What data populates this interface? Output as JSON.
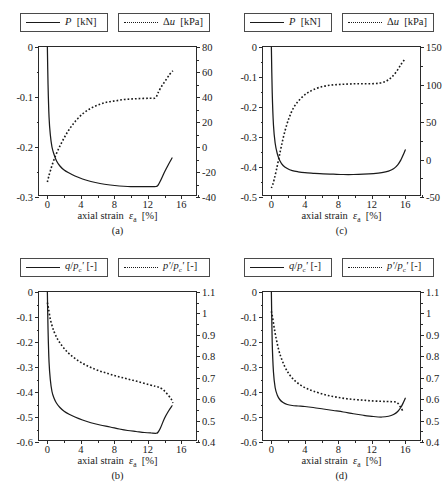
{
  "figure": {
    "width": 448,
    "height": 489,
    "background": "#ffffff",
    "line_color": "#1a1a1a",
    "axis_color": "#2a2a2a"
  },
  "common": {
    "xlabel_prefix": "axial strain ",
    "xlabel_symbol": "ε",
    "xlabel_sub": "a",
    "xlabel_unit": "[%]",
    "xticks": [
      0,
      4,
      8,
      12,
      16
    ],
    "xlim": [
      -1,
      18
    ],
    "xminor": [
      2,
      6,
      10,
      14,
      18
    ]
  },
  "panels": [
    {
      "tag": "(a)",
      "legend": {
        "solid": {
          "symbol": "P",
          "unit": "[kN]",
          "style": "solid"
        },
        "dashed": {
          "symbol": "Δu",
          "unit": "[kPa]",
          "style": "dotted"
        }
      },
      "left_axis": {
        "label": "P [kN]",
        "ticks": [
          0,
          -0.1,
          -0.2,
          -0.3
        ],
        "ticklabels": [
          "0",
          "-0.1",
          "-0.2",
          "-0.3"
        ],
        "lim": [
          -0.3,
          0
        ]
      },
      "right_axis": {
        "label": "Δu [kPa]",
        "ticks": [
          80,
          60,
          40,
          20,
          0,
          -20,
          -40
        ],
        "ticklabels": [
          "80",
          "60",
          "40",
          "20",
          "0",
          "-20",
          "-40"
        ],
        "lim": [
          -40,
          80
        ]
      },
      "chart_data": {
        "type": "line",
        "title": "",
        "xlabel": "axial strain εa [%]",
        "ylabel": "P [kN]",
        "y2label": "Δu [kPa]",
        "xlim": [
          -1,
          18
        ],
        "ylim": [
          -0.3,
          0
        ],
        "y2lim": [
          -40,
          80
        ],
        "grid": false,
        "legend_position": "above-plot",
        "series": [
          {
            "name": "P [kN]",
            "axis": "left",
            "style": "solid",
            "x": [
              0.0,
              0.08,
              0.2,
              0.35,
              0.55,
              0.8,
              1.1,
              1.5,
              2.0,
              2.6,
              3.3,
              4.2,
              5.2,
              6.3,
              7.5,
              8.6,
              9.6,
              10.6,
              11.6,
              12.4,
              13.0,
              13.2,
              13.5,
              14.0,
              14.5,
              14.9
            ],
            "y": [
              0.0,
              -0.075,
              -0.14,
              -0.175,
              -0.2,
              -0.215,
              -0.228,
              -0.238,
              -0.246,
              -0.252,
              -0.258,
              -0.264,
              -0.269,
              -0.273,
              -0.276,
              -0.278,
              -0.279,
              -0.279,
              -0.279,
              -0.279,
              -0.279,
              -0.277,
              -0.268,
              -0.25,
              -0.234,
              -0.222
            ]
          },
          {
            "name": "Δu [kPa]",
            "axis": "right",
            "style": "dotted",
            "x": [
              0.0,
              0.15,
              0.4,
              0.8,
              1.3,
              1.9,
              2.6,
              3.4,
              4.3,
              5.2,
              6.2,
              7.2,
              8.2,
              9.2,
              10.2,
              11.2,
              12.2,
              12.9,
              13.2,
              13.6,
              14.1,
              14.6,
              15.0
            ],
            "y": [
              -28.0,
              -24.0,
              -18.0,
              -10.0,
              -2.0,
              6.0,
              14.0,
              21.0,
              27.0,
              31.0,
              34.0,
              36.0,
              37.0,
              38.0,
              38.5,
              38.8,
              39.0,
              39.2,
              43.0,
              48.0,
              53.0,
              58.0,
              61.0
            ]
          }
        ]
      }
    },
    {
      "tag": "(c)",
      "legend": {
        "solid": {
          "symbol": "P",
          "unit": "[kN]",
          "style": "solid"
        },
        "dashed": {
          "symbol": "Δu",
          "unit": "[kPa]",
          "style": "dotted"
        }
      },
      "left_axis": {
        "label": "P [kN]",
        "ticks": [
          0,
          -0.1,
          -0.2,
          -0.3,
          -0.4,
          -0.5
        ],
        "ticklabels": [
          "0",
          "-0.1",
          "-0.2",
          "-0.3",
          "-0.4",
          "-0.5"
        ],
        "lim": [
          -0.5,
          0
        ]
      },
      "right_axis": {
        "label": "Δu [kPa]",
        "ticks": [
          150,
          100,
          50,
          0,
          -50
        ],
        "ticklabels": [
          "150",
          "100",
          "50",
          "0",
          "-50"
        ],
        "lim": [
          -50,
          150
        ]
      },
      "chart_data": {
        "type": "line",
        "title": "",
        "xlabel": "axial strain εa [%]",
        "ylabel": "P [kN]",
        "y2label": "Δu [kPa]",
        "xlim": [
          -1,
          18
        ],
        "ylim": [
          -0.5,
          0
        ],
        "y2lim": [
          -50,
          150
        ],
        "grid": false,
        "legend_position": "above-plot",
        "series": [
          {
            "name": "P [kN]",
            "axis": "left",
            "style": "solid",
            "x": [
              0.0,
              0.1,
              0.25,
              0.45,
              0.7,
              1.0,
              1.4,
              1.9,
              2.5,
              3.2,
              4.0,
              5.0,
              6.2,
              7.4,
              8.6,
              9.8,
              11.0,
              12.2,
              13.2,
              14.0,
              14.6,
              15.1,
              15.5,
              15.8,
              16.0
            ],
            "y": [
              0.0,
              -0.15,
              -0.26,
              -0.32,
              -0.355,
              -0.378,
              -0.395,
              -0.405,
              -0.412,
              -0.416,
              -0.419,
              -0.421,
              -0.423,
              -0.424,
              -0.425,
              -0.425,
              -0.424,
              -0.422,
              -0.419,
              -0.414,
              -0.406,
              -0.393,
              -0.375,
              -0.357,
              -0.343
            ]
          },
          {
            "name": "Δu [kPa]",
            "axis": "right",
            "style": "dotted",
            "x": [
              0.0,
              0.15,
              0.35,
              0.6,
              0.9,
              1.2,
              1.6,
              2.1,
              2.7,
              3.4,
              4.2,
              5.0,
              6.0,
              7.0,
              8.0,
              9.0,
              10.0,
              11.0,
              12.0,
              13.0,
              13.8,
              14.4,
              15.0,
              15.5,
              15.9
            ],
            "y": [
              -38.0,
              -34.0,
              -26.0,
              -14.0,
              2.0,
              18.0,
              37.0,
              55.0,
              70.0,
              80.0,
              88.0,
              93.0,
              97.0,
              99.0,
              100.0,
              100.5,
              101.0,
              101.0,
              101.0,
              102.0,
              105.0,
              110.0,
              118.0,
              127.0,
              133.0
            ]
          }
        ]
      }
    },
    {
      "tag": "(b)",
      "legend": {
        "solid": {
          "symbol": "q/pc'",
          "unit": "[-]",
          "style": "solid"
        },
        "dashed": {
          "symbol": "p'/pc'",
          "unit": "[-]",
          "style": "dotted"
        }
      },
      "left_axis": {
        "label": "q/pc' [-]",
        "ticks": [
          0,
          -0.1,
          -0.2,
          -0.3,
          -0.4,
          -0.5,
          -0.6
        ],
        "ticklabels": [
          "0",
          "-0.1",
          "-0.2",
          "-0.3",
          "-0.4",
          "-0.5",
          "-0.6"
        ],
        "lim": [
          -0.6,
          0
        ]
      },
      "right_axis": {
        "label": "p'/pc' [-]",
        "ticks": [
          1.1,
          1.0,
          0.9,
          0.8,
          0.7,
          0.6,
          0.5,
          0.4
        ],
        "ticklabels": [
          "1.1",
          "1",
          "0.9",
          "0.8",
          "0.7",
          "0.6",
          "0.5",
          "0.4"
        ],
        "lim": [
          0.4,
          1.1
        ]
      },
      "chart_data": {
        "type": "line",
        "title": "",
        "xlabel": "axial strain εa [%]",
        "ylabel": "q/pc' [-]",
        "y2label": "p'/pc' [-]",
        "xlim": [
          -1,
          18
        ],
        "ylim": [
          -0.6,
          0
        ],
        "y2lim": [
          0.4,
          1.1
        ],
        "grid": false,
        "legend_position": "above-plot",
        "series": [
          {
            "name": "q/pc' [-]",
            "axis": "left",
            "style": "solid",
            "x": [
              0.0,
              0.08,
              0.2,
              0.35,
              0.55,
              0.8,
              1.1,
              1.5,
              2.0,
              2.6,
              3.3,
              4.2,
              5.2,
              6.3,
              7.5,
              8.6,
              9.6,
              10.6,
              11.6,
              12.4,
              13.0,
              13.2,
              13.5,
              14.0,
              14.5,
              14.9
            ],
            "y": [
              0.0,
              -0.15,
              -0.28,
              -0.35,
              -0.398,
              -0.425,
              -0.445,
              -0.462,
              -0.477,
              -0.489,
              -0.5,
              -0.512,
              -0.523,
              -0.532,
              -0.54,
              -0.548,
              -0.554,
              -0.558,
              -0.562,
              -0.564,
              -0.565,
              -0.562,
              -0.545,
              -0.505,
              -0.475,
              -0.455
            ]
          },
          {
            "name": "p'/pc' [-]",
            "axis": "right",
            "style": "dotted",
            "x": [
              0.0,
              0.15,
              0.4,
              0.8,
              1.3,
              1.9,
              2.6,
              3.4,
              4.3,
              5.2,
              6.2,
              7.2,
              8.2,
              9.2,
              10.2,
              11.2,
              12.2,
              12.9,
              13.3,
              13.8,
              14.3,
              14.8,
              15.0
            ],
            "y": [
              1.05,
              1.02,
              0.965,
              0.915,
              0.875,
              0.842,
              0.812,
              0.787,
              0.765,
              0.748,
              0.732,
              0.72,
              0.708,
              0.698,
              0.688,
              0.678,
              0.667,
              0.66,
              0.656,
              0.645,
              0.625,
              0.6,
              0.582
            ]
          }
        ]
      }
    },
    {
      "tag": "(d)",
      "legend": {
        "solid": {
          "symbol": "q/pc'",
          "unit": "[-]",
          "style": "solid"
        },
        "dashed": {
          "symbol": "p'/pc'",
          "unit": "[-]",
          "style": "dotted"
        }
      },
      "left_axis": {
        "label": "q/pc' [-]",
        "ticks": [
          0,
          -0.1,
          -0.2,
          -0.3,
          -0.4,
          -0.5,
          -0.6
        ],
        "ticklabels": [
          "0",
          "-0.1",
          "-0.2",
          "-0.3",
          "-0.4",
          "-0.5",
          "-0.6"
        ],
        "lim": [
          -0.6,
          0
        ]
      },
      "right_axis": {
        "label": "p'/pc' [-]",
        "ticks": [
          1.1,
          1.0,
          0.9,
          0.8,
          0.7,
          0.6,
          0.5,
          0.4
        ],
        "ticklabels": [
          "1.1",
          "1",
          "0.9",
          "0.8",
          "0.7",
          "0.6",
          "0.5",
          "0.4"
        ],
        "lim": [
          0.4,
          1.1
        ]
      },
      "chart_data": {
        "type": "line",
        "title": "",
        "xlabel": "axial strain εa [%]",
        "ylabel": "q/pc' [-]",
        "y2label": "p'/pc' [-]",
        "xlim": [
          -1,
          18
        ],
        "ylim": [
          -0.6,
          0
        ],
        "y2lim": [
          0.4,
          1.1
        ],
        "grid": false,
        "legend_position": "above-plot",
        "series": [
          {
            "name": "q/pc' [-]",
            "axis": "left",
            "style": "solid",
            "x": [
              0.0,
              0.1,
              0.25,
              0.45,
              0.7,
              1.0,
              1.4,
              1.9,
              2.5,
              3.2,
              4.0,
              5.0,
              6.2,
              7.4,
              8.6,
              9.8,
              11.0,
              12.2,
              13.2,
              14.0,
              14.6,
              15.1,
              15.5,
              15.8,
              16.0
            ],
            "y": [
              0.0,
              -0.2,
              -0.32,
              -0.382,
              -0.412,
              -0.43,
              -0.442,
              -0.45,
              -0.454,
              -0.456,
              -0.458,
              -0.462,
              -0.468,
              -0.474,
              -0.48,
              -0.487,
              -0.493,
              -0.498,
              -0.5,
              -0.497,
              -0.49,
              -0.478,
              -0.46,
              -0.44,
              -0.425
            ]
          },
          {
            "name": "p'/pc' [-]",
            "axis": "right",
            "style": "dotted",
            "x": [
              0.0,
              0.15,
              0.35,
              0.6,
              0.9,
              1.2,
              1.6,
              2.1,
              2.7,
              3.4,
              4.2,
              5.0,
              6.0,
              7.0,
              8.0,
              9.0,
              10.0,
              11.0,
              12.0,
              13.0,
              13.8,
              14.4,
              15.0,
              15.4,
              15.7
            ],
            "y": [
              1.01,
              0.98,
              0.93,
              0.878,
              0.826,
              0.79,
              0.752,
              0.718,
              0.69,
              0.668,
              0.65,
              0.638,
              0.625,
              0.615,
              0.608,
              0.602,
              0.598,
              0.595,
              0.592,
              0.59,
              0.589,
              0.588,
              0.585,
              0.565,
              0.545
            ]
          }
        ]
      }
    }
  ]
}
